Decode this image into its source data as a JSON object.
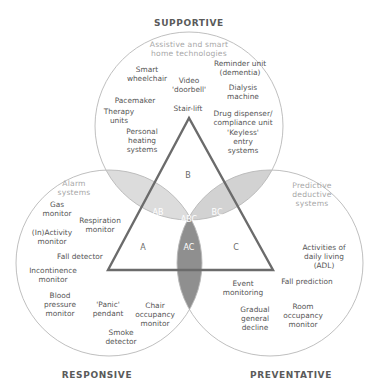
{
  "headings": {
    "top": "SUPPORTIVE",
    "bottom_left": "RESPONSIVE",
    "bottom_right": "PREVENTATIVE"
  },
  "categories": {
    "top": [
      "Assistive and smart",
      "home technologies"
    ],
    "left": [
      "Alarm",
      "systems"
    ],
    "right": [
      "Predictive",
      "deductive",
      "systems"
    ]
  },
  "regions": {
    "A": "A",
    "B": "B",
    "C": "C",
    "AB": "AB",
    "BC": "BC",
    "AC": "AC",
    "ABC": "ABC"
  },
  "items": {
    "supportive": [
      {
        "lines": [
          "Smart",
          "wheelchair"
        ],
        "x": 147,
        "y": 72
      },
      {
        "lines": [
          "Video",
          "'doorbell'"
        ],
        "x": 189,
        "y": 83
      },
      {
        "lines": [
          "Reminder unit",
          "(dementia)"
        ],
        "x": 240,
        "y": 66
      },
      {
        "lines": [
          "Dialysis",
          "machine"
        ],
        "x": 243,
        "y": 90
      },
      {
        "lines": [
          "Pacemaker"
        ],
        "x": 135,
        "y": 103
      },
      {
        "lines": [
          "Therapy",
          "units"
        ],
        "x": 119,
        "y": 114
      },
      {
        "lines": [
          "Stair-lift"
        ],
        "x": 188,
        "y": 111
      },
      {
        "lines": [
          "Drug dispenser/",
          "compliance unit"
        ],
        "x": 243,
        "y": 116
      },
      {
        "lines": [
          "Personal",
          "heating",
          "systems"
        ],
        "x": 142,
        "y": 134
      },
      {
        "lines": [
          "'Keyless'",
          "entry",
          "systems"
        ],
        "x": 243,
        "y": 135
      }
    ],
    "responsive": [
      {
        "lines": [
          "Gas",
          "monitor"
        ],
        "x": 57,
        "y": 207
      },
      {
        "lines": [
          "Respiration",
          "monitor"
        ],
        "x": 100,
        "y": 223
      },
      {
        "lines": [
          "(In)Activity",
          "monitor"
        ],
        "x": 52,
        "y": 235
      },
      {
        "lines": [
          "Fall detector"
        ],
        "x": 80,
        "y": 259
      },
      {
        "lines": [
          "Incontinence",
          "monitor"
        ],
        "x": 53,
        "y": 273
      },
      {
        "lines": [
          "Blood",
          "pressure",
          "monitor"
        ],
        "x": 60,
        "y": 298
      },
      {
        "lines": [
          "'Panic'",
          "pendant"
        ],
        "x": 108,
        "y": 307
      },
      {
        "lines": [
          "Chair",
          "occupancy",
          "monitor"
        ],
        "x": 155,
        "y": 308
      },
      {
        "lines": [
          "Smoke",
          "detector"
        ],
        "x": 121,
        "y": 335
      }
    ],
    "preventative": [
      {
        "lines": [
          "Activities of",
          "daily living",
          "(ADL)"
        ],
        "x": 324,
        "y": 250
      },
      {
        "lines": [
          "Fall prediction"
        ],
        "x": 307,
        "y": 284
      },
      {
        "lines": [
          "Event",
          "monitoring"
        ],
        "x": 243,
        "y": 286
      },
      {
        "lines": [
          "Room",
          "occupancy",
          "monitor"
        ],
        "x": 303,
        "y": 309
      },
      {
        "lines": [
          "Gradual",
          "general",
          "decline"
        ],
        "x": 255,
        "y": 312
      }
    ]
  },
  "colors": {
    "circle_stroke": "#b8b8b8",
    "light_overlap": "#d9d9d9",
    "mid_overlap": "#e6e6e6",
    "dark_overlap": "#8e8e8e",
    "abc_center": "#bdbdbd",
    "triangle_stroke": "#6b6b6b"
  }
}
